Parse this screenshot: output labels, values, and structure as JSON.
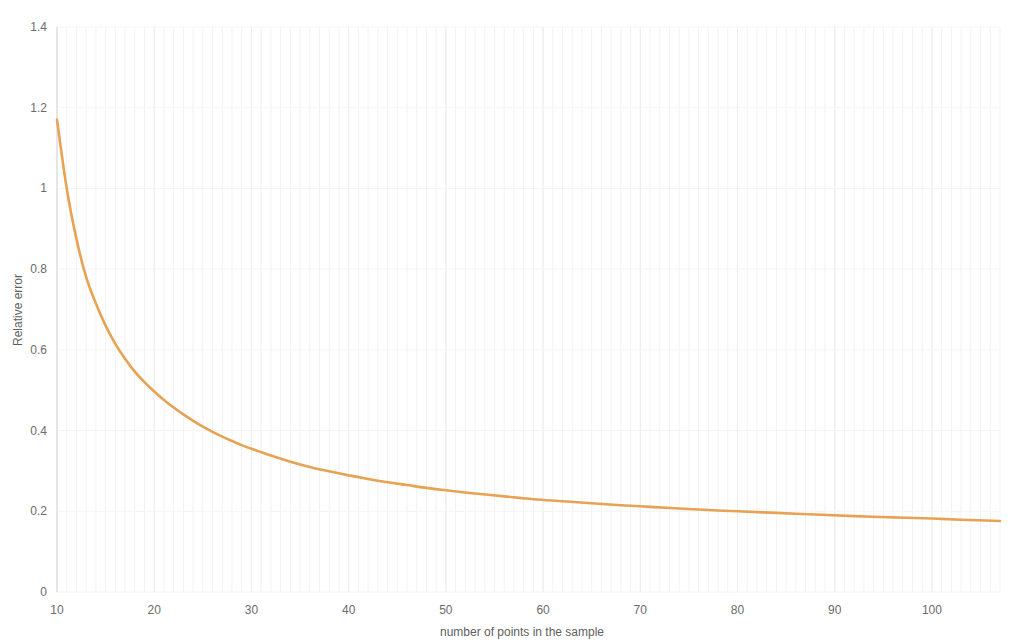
{
  "chart_data": {
    "type": "line",
    "title": "",
    "subtitle": "",
    "xlabel": "number of points in the sample",
    "ylabel": "Relative error",
    "xlim": [
      10,
      107
    ],
    "ylim": [
      0,
      1.4
    ],
    "xticks": [
      10,
      20,
      30,
      40,
      50,
      60,
      70,
      80,
      90,
      100
    ],
    "xtick_labels": [
      "10",
      "20",
      "30",
      "40",
      "50",
      "60",
      "70",
      "80",
      "90",
      "100"
    ],
    "yticks": [
      0,
      0.2,
      0.4,
      0.6,
      0.8,
      1,
      1.2,
      1.4
    ],
    "ytick_labels": [
      "0",
      "0.2",
      "0.4",
      "0.6",
      "0.8",
      "1",
      "1.2",
      "1.4"
    ],
    "grid": {
      "vertical_minor": true,
      "vertical_major": true,
      "horizontal": true
    },
    "legend": {
      "visible": false,
      "position": "none",
      "entries": []
    },
    "series": [
      {
        "name": "Relative error",
        "color": "#E8A253",
        "line_width": 2.6,
        "x": [
          10,
          11,
          12,
          13,
          14,
          15,
          16,
          17,
          18,
          19,
          20,
          21,
          22,
          23,
          24,
          25,
          26,
          27,
          28,
          29,
          30,
          32,
          34,
          36,
          38,
          40,
          42,
          44,
          46,
          48,
          50,
          53,
          56,
          59,
          62,
          65,
          68,
          71,
          74,
          77,
          80,
          84,
          88,
          92,
          96,
          100,
          103,
          107
        ],
        "y": [
          1.17,
          1.0,
          0.875,
          0.78,
          0.715,
          0.66,
          0.615,
          0.578,
          0.546,
          0.52,
          0.497,
          0.476,
          0.457,
          0.44,
          0.424,
          0.41,
          0.397,
          0.385,
          0.374,
          0.364,
          0.355,
          0.338,
          0.323,
          0.31,
          0.299,
          0.289,
          0.28,
          0.272,
          0.265,
          0.258,
          0.252,
          0.244,
          0.237,
          0.23,
          0.225,
          0.22,
          0.215,
          0.211,
          0.207,
          0.203,
          0.2,
          0.196,
          0.192,
          0.188,
          0.185,
          0.182,
          0.179,
          0.176
        ]
      }
    ]
  },
  "axes": {
    "y_axis_title": "Relative error",
    "x_axis_title": "number of points in the sample"
  },
  "colors": {
    "series_orange": "#E8A253",
    "grid_minor": "#f2f2f2",
    "grid_major": "#ededed",
    "axis_text": "#6b6b6b",
    "background": "#ffffff"
  }
}
